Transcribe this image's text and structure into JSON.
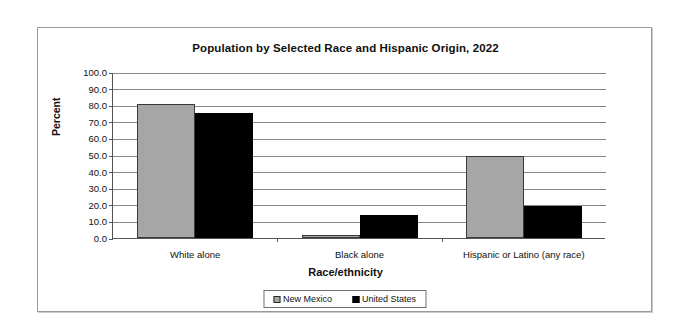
{
  "chart_data": {
    "type": "bar",
    "title": "Population by Selected Race and Hispanic Origin, 2022",
    "xlabel": "Race/ethnicity",
    "ylabel": "Percent",
    "categories": [
      "White alone",
      "Black alone",
      "Hispanic or Latino (any race)"
    ],
    "series": [
      {
        "name": "New Mexico",
        "color": "#a6a6a6",
        "values": [
          81.0,
          2.0,
          49.5
        ]
      },
      {
        "name": "United States",
        "color": "#000000",
        "values": [
          75.5,
          13.6,
          19.1
        ]
      }
    ],
    "ylim": [
      0.0,
      100.0
    ],
    "ytick_labels": [
      "100.0",
      "90.0",
      "80.0",
      "70.0",
      "60.0",
      "50.0",
      "40.0",
      "30.0",
      "20.0",
      "10.0",
      "0.0"
    ],
    "ytick_values": [
      100,
      90,
      80,
      70,
      60,
      50,
      40,
      30,
      20,
      10,
      0
    ],
    "grid": true,
    "legend_position": "bottom"
  }
}
